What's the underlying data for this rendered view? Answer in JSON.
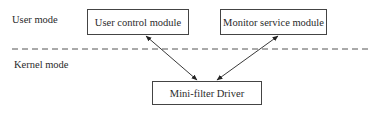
{
  "diagram": {
    "regions": {
      "user_mode_label": "User mode",
      "kernel_mode_label": "Kernel mode"
    },
    "nodes": [
      {
        "id": "user-control",
        "label": "User control module"
      },
      {
        "id": "monitor-service",
        "label": "Monitor service module"
      },
      {
        "id": "minifilter",
        "label": "Mini-filter Driver"
      }
    ],
    "edges": [
      {
        "from": "user-control",
        "to": "minifilter",
        "direction": "bidirectional"
      },
      {
        "from": "monitor-service",
        "to": "minifilter",
        "direction": "bidirectional"
      }
    ],
    "separator": "dashed-line"
  }
}
